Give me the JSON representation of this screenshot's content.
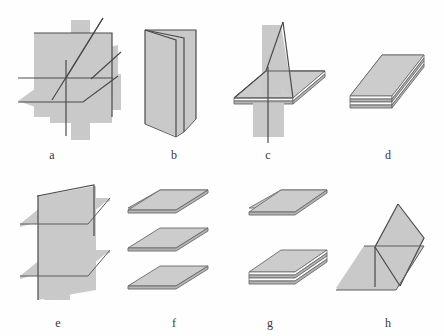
{
  "figure": {
    "background_color": "#fefefe",
    "plane_fill_color": "#c9c9c9",
    "plane_edge_color": "#4a4a4c",
    "label_color": "#39393b",
    "width": 444,
    "height": 336
  },
  "panels": [
    {
      "key": "a",
      "label": "a",
      "label_x": 50,
      "label_y": 150,
      "description": "Two large vertical planes crossing a horizontal plane; a slanted line passes through the intersection"
    },
    {
      "key": "b",
      "label": "b",
      "label_x": 172,
      "label_y": 150,
      "description": "Three vertical half-planes hinged along a common vertical edge, like an open book"
    },
    {
      "key": "c",
      "label": "c",
      "label_x": 265,
      "label_y": 150,
      "description": "A vertical plane intersecting a stack of two thin horizontal sheets"
    },
    {
      "key": "d",
      "label": "d",
      "label_x": 385,
      "label_y": 150,
      "description": "A stack of three parallel horizontal sheets separated by thin gaps"
    },
    {
      "key": "e",
      "label": "e",
      "label_x": 56,
      "label_y": 318,
      "description": "A vertical plane intersected by two separate parallel horizontal planes"
    },
    {
      "key": "f",
      "label": "f",
      "label_x": 172,
      "label_y": 318,
      "description": "Three separate parallel horizontal planes stacked with visible gaps"
    },
    {
      "key": "g",
      "label": "g",
      "label_x": 268,
      "label_y": 318,
      "description": "One single horizontal plane above a stack of two thin horizontal sheets"
    },
    {
      "key": "h",
      "label": "h",
      "label_x": 385,
      "label_y": 318,
      "description": "Two tilted planes meeting in a V-shape rising from a horizontal plane"
    }
  ]
}
